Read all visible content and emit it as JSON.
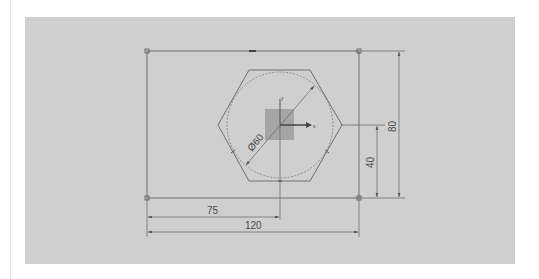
{
  "sketch": {
    "dimensions": {
      "horizontal_offset": "75",
      "width": "120",
      "vertical_offset": "40",
      "height": "80",
      "diameter": "Ø60"
    },
    "axis_labels": {
      "x": "x",
      "y": "y"
    },
    "colors": {
      "canvas": "#cfcfcf",
      "line": "#6e6e6e",
      "origin_square": "#9a9a9a",
      "page": "#ffffff"
    }
  }
}
